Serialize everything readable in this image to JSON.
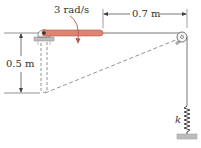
{
  "diagram": {
    "labels": {
      "angular_velocity": "3 rad/s",
      "horizontal_distance": "0.7 m",
      "vertical_distance": "0.5 m",
      "spring_constant": "k"
    },
    "colors": {
      "rod": "#e2836f",
      "rod_edge": "#b05a48",
      "line": "#555555",
      "ground": "#b8b8b8"
    },
    "elements": [
      "pin-support",
      "rotating-rod",
      "dashed-rod-position",
      "cable",
      "pulley",
      "spring",
      "ground-support"
    ]
  }
}
